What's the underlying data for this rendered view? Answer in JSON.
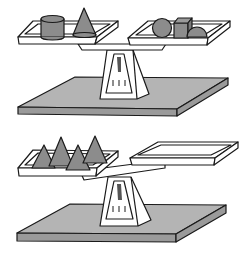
{
  "figure": {
    "colors": {
      "background": "#ffffff",
      "outline": "#1a1a1a",
      "object_fill": "#8c8c8c",
      "base_fill": "#b4b4b4",
      "base_edge_fill": "#9a9a9a",
      "tray_fill": "#ffffff"
    },
    "scales": [
      {
        "id": "top",
        "state": "balanced",
        "left_pan_objects": [
          "cylinder",
          "cone"
        ],
        "right_pan_objects": [
          "sphere",
          "cube",
          "hemisphere"
        ]
      },
      {
        "id": "bottom",
        "state": "tipped-left",
        "left_pan_objects": [
          "cone",
          "cone",
          "cone",
          "cone"
        ],
        "right_pan_objects": []
      }
    ]
  }
}
